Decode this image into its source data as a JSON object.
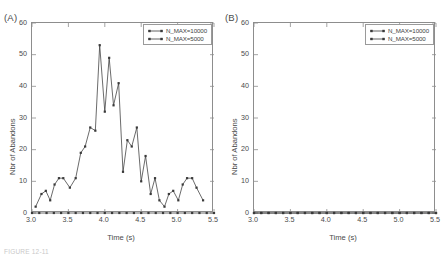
{
  "figure": {
    "caption": "FIGURE 12-11"
  },
  "panels": [
    {
      "letter": "(A)",
      "xlabel": "Time (s)",
      "ylabel": "Nbr of Abandons",
      "xticks": [
        "3.0",
        "3.5",
        "4.0",
        "4.5",
        "5.0",
        "5.5"
      ],
      "yticks": [
        "0",
        "10",
        "20",
        "30",
        "40",
        "50",
        "60"
      ],
      "legend": [
        {
          "label": "N_MAX=10000",
          "color": "#3a3a3a",
          "marker": "square"
        },
        {
          "label": "N_MAX=5000",
          "color": "#3a3a3a",
          "marker": "square"
        }
      ]
    },
    {
      "letter": "(B)",
      "xlabel": "Time (s)",
      "ylabel": "Nbr of Abandons",
      "xticks": [
        "3.0",
        "3.5",
        "4.0",
        "4.5",
        "5.0",
        "5.5"
      ],
      "yticks": [
        "0",
        "10",
        "20",
        "30",
        "40",
        "50",
        "60"
      ],
      "legend": [
        {
          "label": "N_MAX=10000",
          "color": "#3a3a3a",
          "marker": "square"
        },
        {
          "label": "N_MAX=5000",
          "color": "#3a3a3a",
          "marker": "square"
        }
      ]
    }
  ],
  "chart_data": [
    {
      "type": "line",
      "panel": "(A)",
      "title": "",
      "xlabel": "Time (s)",
      "ylabel": "Nbr of Abandons",
      "xlim": [
        3.0,
        5.5
      ],
      "ylim": [
        0,
        60
      ],
      "grid": false,
      "legend_position": "top-right",
      "series": [
        {
          "name": "N_MAX=10000",
          "color": "#3a3a3a",
          "marker": "square",
          "x": [
            3.05,
            3.13,
            3.19,
            3.25,
            3.31,
            3.37,
            3.43,
            3.52,
            3.6,
            3.67,
            3.73,
            3.8,
            3.87,
            3.93,
            4.0,
            4.06,
            4.12,
            4.19,
            4.25,
            4.31,
            4.37,
            4.44,
            4.5,
            4.56,
            4.63,
            4.69,
            4.75,
            4.82,
            4.88,
            4.94,
            5.01,
            5.07,
            5.13,
            5.2,
            5.26,
            5.35
          ],
          "y": [
            2,
            6,
            7,
            4,
            9,
            11,
            11,
            8,
            11,
            19,
            21,
            27,
            26,
            53,
            32,
            49,
            34,
            41,
            13,
            23,
            21,
            27,
            10,
            18,
            6,
            11,
            4,
            2,
            6,
            7,
            4,
            9,
            11,
            11,
            8,
            4
          ]
        },
        {
          "name": "N_MAX=5000",
          "color": "#3a3a3a",
          "marker": "square",
          "x": [
            3.0,
            3.1,
            3.2,
            3.3,
            3.4,
            3.5,
            3.6,
            3.7,
            3.8,
            3.9,
            4.0,
            4.1,
            4.2,
            4.3,
            4.4,
            4.5,
            4.6,
            4.7,
            4.8,
            4.9,
            5.0,
            5.1,
            5.2,
            5.3,
            5.4,
            5.5
          ],
          "y": [
            0,
            0,
            0,
            0,
            0,
            0,
            0,
            0,
            0,
            0,
            0,
            0,
            0,
            0,
            0,
            0,
            0,
            0,
            0,
            0,
            0,
            0,
            0,
            0,
            0,
            0
          ]
        }
      ]
    },
    {
      "type": "line",
      "panel": "(B)",
      "title": "",
      "xlabel": "Time (s)",
      "ylabel": "Nbr of Abandons",
      "xlim": [
        3.0,
        5.5
      ],
      "ylim": [
        0,
        60
      ],
      "grid": false,
      "legend_position": "top-right",
      "series": [
        {
          "name": "N_MAX=10000",
          "color": "#3a3a3a",
          "marker": "square",
          "x": [
            3.0,
            3.1,
            3.2,
            3.3,
            3.4,
            3.5,
            3.6,
            3.7,
            3.8,
            3.9,
            4.0,
            4.1,
            4.2,
            4.3,
            4.4,
            4.5,
            4.6,
            4.7,
            4.8,
            4.9,
            5.0,
            5.1,
            5.2,
            5.3,
            5.4,
            5.5
          ],
          "y": [
            0,
            0,
            0,
            0,
            0,
            0,
            0,
            0,
            0,
            0,
            0,
            0,
            0,
            0,
            0,
            0,
            0,
            0,
            0,
            0,
            0,
            0,
            0,
            0,
            0,
            0
          ]
        },
        {
          "name": "N_MAX=5000",
          "color": "#3a3a3a",
          "marker": "square",
          "x": [
            3.0,
            3.1,
            3.2,
            3.3,
            3.4,
            3.5,
            3.6,
            3.7,
            3.8,
            3.9,
            4.0,
            4.1,
            4.2,
            4.3,
            4.4,
            4.5,
            4.6,
            4.7,
            4.8,
            4.9,
            5.0,
            5.1,
            5.2,
            5.3,
            5.4,
            5.5
          ],
          "y": [
            0,
            0,
            0,
            0,
            0,
            0,
            0,
            0,
            0,
            0,
            0,
            0,
            0,
            0,
            0,
            0,
            0,
            0,
            0,
            0,
            0,
            0,
            0,
            0,
            0,
            0
          ]
        }
      ]
    }
  ]
}
